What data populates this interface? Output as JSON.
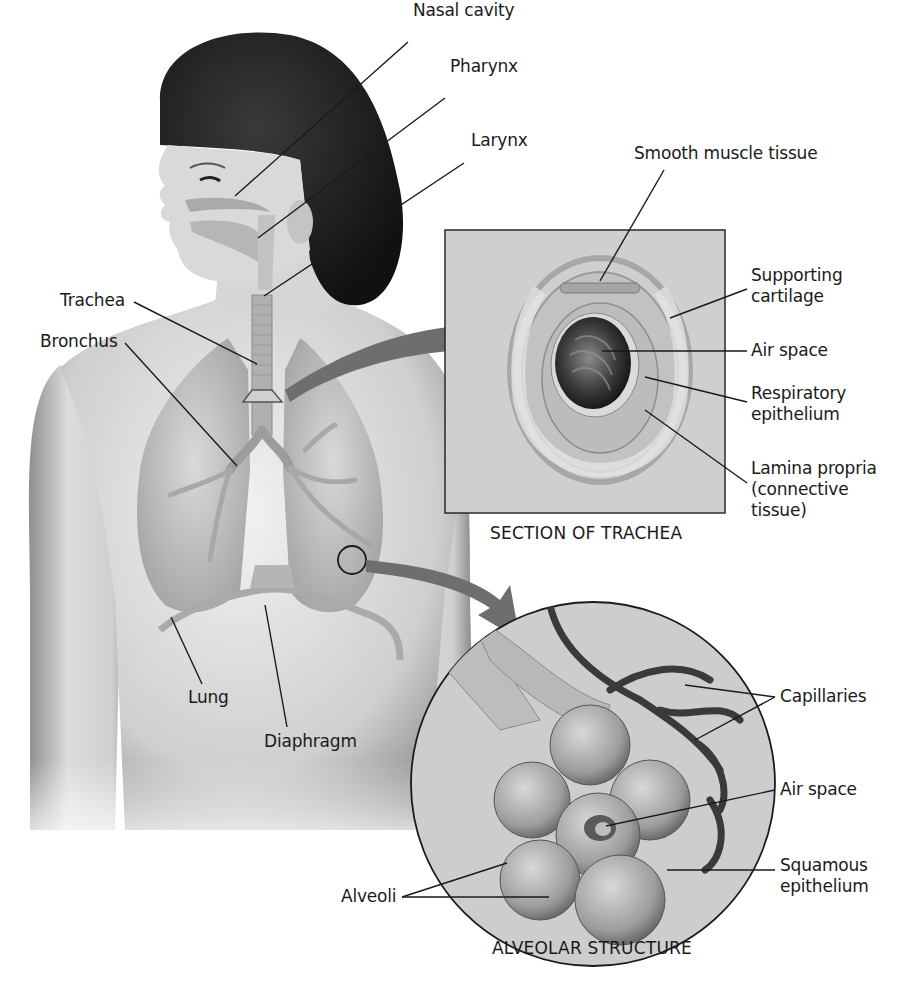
{
  "figure": {
    "colors": {
      "background": "#ffffff",
      "skin_light": "#e6e6e6",
      "skin_shade": "#8a8a8a",
      "hair": "#1b1b1b",
      "organ_fill": "#bdbdbd",
      "panel_bg": "#cfcfcf",
      "arrow": "#6e6e6e",
      "leader_line": "#1a1a1a",
      "capillary": "#3a3a3a"
    }
  },
  "body_labels": {
    "nasal_cavity": "Nasal cavity",
    "pharynx": "Pharynx",
    "larynx": "Larynx",
    "trachea": "Trachea",
    "bronchus": "Bronchus",
    "lung": "Lung",
    "diaphragm": "Diaphragm"
  },
  "trachea_section": {
    "caption": "SECTION OF TRACHEA",
    "labels": {
      "smooth_muscle": "Smooth muscle tissue",
      "supporting_cartilage": [
        "Supporting",
        "cartilage"
      ],
      "air_space": "Air space",
      "respiratory_epithelium": [
        "Respiratory",
        "epithelium"
      ],
      "lamina_propria": [
        "Lamina propria",
        "(connective",
        "tissue)"
      ]
    }
  },
  "alveolar_section": {
    "caption": "ALVEOLAR STRUCTURE",
    "labels": {
      "capillaries": "Capillaries",
      "air_space": "Air space",
      "squamous_epithelium": [
        "Squamous",
        "epithelium"
      ],
      "alveoli": "Alveoli"
    }
  }
}
